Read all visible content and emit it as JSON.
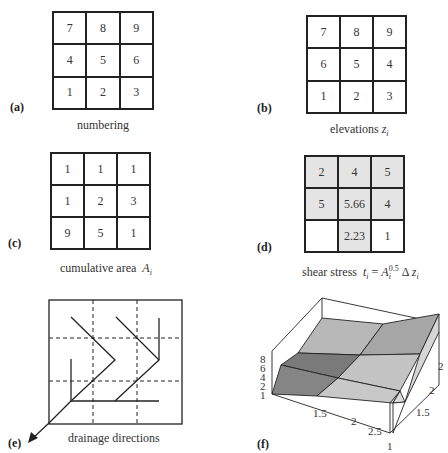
{
  "panels": {
    "a": {
      "label": "(a)",
      "caption": "numbering",
      "cells": [
        "7",
        "8",
        "9",
        "4",
        "5",
        "6",
        "1",
        "2",
        "3"
      ]
    },
    "b": {
      "label": "(b)",
      "caption": "elevations",
      "caption_var": "z",
      "caption_sub": "i",
      "cells": [
        "7",
        "8",
        "9",
        "6",
        "5",
        "4",
        "1",
        "2",
        "3"
      ]
    },
    "c": {
      "label": "(c)",
      "caption": "cumulative area",
      "caption_var": "A",
      "caption_sub": "i",
      "cells": [
        "1",
        "1",
        "1",
        "1",
        "2",
        "3",
        "9",
        "5",
        "1"
      ]
    },
    "d": {
      "label": "(d)",
      "caption": "shear stress",
      "formula_lhs": "t",
      "formula_lhs_sub": "i",
      "formula_eq": "=",
      "formula_A": "A",
      "formula_A_sub": "i",
      "formula_A_sup": "0.5",
      "formula_delta": "Δ",
      "formula_z": "z",
      "formula_z_sub": "i",
      "cells": [
        "2",
        "4",
        "5",
        "5",
        "5.66",
        "4",
        "",
        "2.23",
        "1"
      ],
      "shaded": [
        true,
        true,
        true,
        true,
        true,
        true,
        false,
        true,
        false
      ]
    },
    "e": {
      "label": "(e)",
      "caption": "drainage directions"
    },
    "f": {
      "label": "(f)",
      "z_ticks": [
        "8",
        "6",
        "4",
        "2",
        "1"
      ],
      "x_ticks": [
        "1.5",
        "2",
        "2.5"
      ],
      "y_ticks": [
        "1",
        "1.5",
        "2",
        "2"
      ]
    }
  },
  "colors": {
    "line": "#222222",
    "shaded_cell": "#e4e4e4",
    "surface_dark": "#7a7a7a",
    "surface_mid": "#a8a8a8",
    "surface_light": "#c6c6c6",
    "surface_side": "#d8d8d8"
  }
}
